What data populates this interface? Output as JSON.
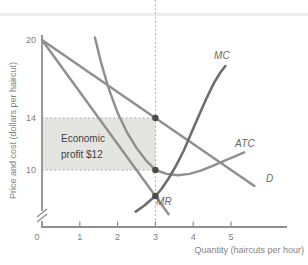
{
  "chart_data": {
    "type": "line",
    "xlabel": "Quantity (haircuts per hour)",
    "ylabel": "Price and cost (dollars per haircut)",
    "x_ticks": [
      "0",
      "1",
      "2",
      "3",
      "4",
      "5"
    ],
    "x_tick_values": [
      0,
      1,
      2,
      3,
      4,
      5
    ],
    "y_tick_values": [
      20,
      14,
      10
    ],
    "xlim": [
      0,
      6.5
    ],
    "ylim": [
      6,
      21
    ],
    "grid": false,
    "axis_break_on_y": true,
    "colors": {
      "curve": "#8f8f8f",
      "mc_curve": "#6e6e6e",
      "marker": "#4a4a4a",
      "axis": "#8f8f8f",
      "guide": "#a0a0a0",
      "profit_fill": "#e4e5e1",
      "tick_text": "#808080",
      "curve_label": "#666666",
      "profit_text": "#3f3f3f",
      "divider": "#ececec"
    },
    "series": [
      {
        "name": "D",
        "label": "D",
        "points": [
          [
            0,
            20
          ],
          [
            3,
            14
          ],
          [
            5.62,
            8.76
          ]
        ]
      },
      {
        "name": "MR",
        "label": "MR",
        "points": [
          [
            0,
            20
          ],
          [
            3,
            8
          ],
          [
            3.35,
            6.6
          ]
        ]
      },
      {
        "name": "ATC",
        "label": "ATC",
        "points": [
          [
            1.4,
            20.2
          ],
          [
            1.55,
            18.4
          ],
          [
            1.75,
            16.4
          ],
          [
            2.0,
            14.4
          ],
          [
            2.25,
            12.9
          ],
          [
            2.5,
            11.7
          ],
          [
            2.75,
            10.75
          ],
          [
            3.0,
            10.0
          ],
          [
            3.3,
            9.7
          ],
          [
            3.6,
            9.6
          ],
          [
            3.9,
            9.7
          ],
          [
            4.2,
            9.95
          ],
          [
            4.5,
            10.3
          ],
          [
            4.85,
            10.75
          ],
          [
            5.15,
            11.1
          ],
          [
            5.35,
            11.35
          ]
        ]
      },
      {
        "name": "MC",
        "label": "MC",
        "points": [
          [
            2.48,
            6.8
          ],
          [
            2.7,
            7.25
          ],
          [
            2.9,
            7.75
          ],
          [
            3.0,
            8.0
          ],
          [
            3.15,
            8.5
          ],
          [
            3.35,
            9.35
          ],
          [
            3.55,
            10.35
          ],
          [
            3.75,
            11.5
          ],
          [
            3.95,
            12.85
          ],
          [
            4.15,
            14.2
          ],
          [
            4.35,
            15.5
          ],
          [
            4.55,
            16.7
          ],
          [
            4.72,
            17.5
          ],
          [
            4.85,
            18.0
          ]
        ]
      }
    ],
    "markers": [
      {
        "q": 3,
        "p": 14,
        "meaning": "profit-maximizing price on D"
      },
      {
        "q": 3,
        "p": 10,
        "meaning": "average total cost at Q=3"
      },
      {
        "q": 3,
        "p": 8,
        "meaning": "MR = MC point"
      }
    ],
    "guide_vline_x": 3,
    "guide_hlines": [
      {
        "p": 14,
        "to_q": 3
      },
      {
        "p": 10,
        "to_q": 3
      }
    ],
    "profit_region": {
      "q": [
        0,
        3
      ],
      "p": [
        10,
        14
      ],
      "label": "Economic profit $12"
    }
  }
}
